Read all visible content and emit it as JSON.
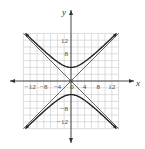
{
  "chart_data": {
    "type": "line",
    "title": "",
    "xlabel": "x",
    "ylabel": "y",
    "xlim": [
      -14,
      14
    ],
    "ylim": [
      -14,
      14
    ],
    "grid": true,
    "grid_step": 2,
    "x_ticks": [
      -12,
      -8,
      -4,
      0,
      4,
      8,
      12
    ],
    "x_tick_labels": [
      "−12",
      "−8",
      "−4",
      "0",
      "4",
      "8",
      "12"
    ],
    "y_ticks": [
      12,
      8,
      -8,
      -12
    ],
    "y_tick_labels": [
      "12",
      "8",
      "−8",
      "−12"
    ],
    "series": [
      {
        "name": "hyperbola upper branch",
        "equation": "y^2/16 - x^2/16 = 1 (y > 0)",
        "x": [
          -13,
          -12,
          -8,
          -4,
          0,
          4,
          8,
          12,
          13
        ],
        "values": [
          13.6,
          12.65,
          8.94,
          5.66,
          4,
          5.66,
          8.94,
          12.65,
          13.6
        ]
      },
      {
        "name": "hyperbola lower branch",
        "equation": "y^2/16 - x^2/16 = 1 (y < 0)",
        "x": [
          -13,
          -12,
          -8,
          -4,
          0,
          4,
          8,
          12,
          13
        ],
        "values": [
          -13.6,
          -12.65,
          -8.94,
          -5.66,
          -4,
          -5.66,
          -8.94,
          -12.65,
          -13.6
        ]
      },
      {
        "name": "asymptote y = x",
        "x": [
          -14,
          14
        ],
        "values": [
          -14,
          14
        ]
      },
      {
        "name": "asymptote y = -x",
        "x": [
          -14,
          14
        ],
        "values": [
          14,
          -14
        ]
      }
    ],
    "annotations": [
      "vertices at (0, 4) and (0, -4)",
      "center at origin"
    ]
  },
  "colors": {
    "curve": "#222222",
    "asymptote": "#555555",
    "grid": "#c8c8c8",
    "axis": "#333333"
  }
}
